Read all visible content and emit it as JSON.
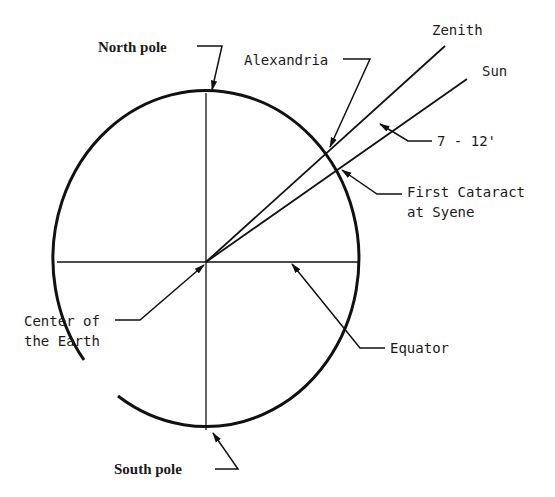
{
  "diagram": {
    "labels": {
      "north_pole": "North pole",
      "south_pole": "South pole",
      "alexandria": "Alexandria",
      "zenith": "Zenith",
      "sun": "Sun",
      "angle": "7 - 12'",
      "first_cataract_line1": "First Cataract",
      "first_cataract_line2": "at Syene",
      "center_line1": "Center of",
      "center_line2": "the Earth",
      "equator": "Equator"
    },
    "colors": {
      "ink": "#111111",
      "background": "#ffffff"
    }
  }
}
